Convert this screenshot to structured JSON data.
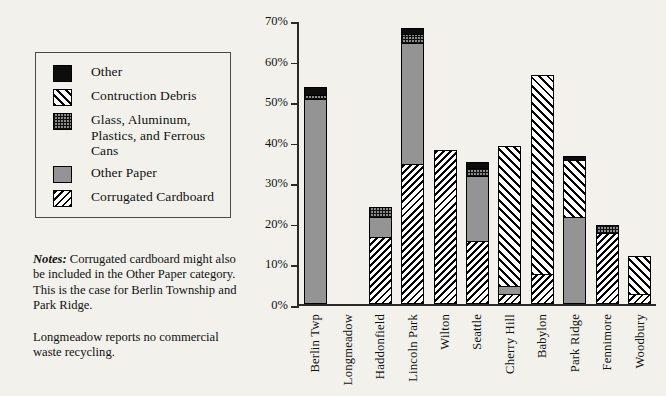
{
  "legend": {
    "items": [
      {
        "label": "Other",
        "key": "other",
        "swatch": "solid-black-swatch"
      },
      {
        "label": "Contruction Debris",
        "key": "construction_debris",
        "swatch": "diagonal-hatch-swatch"
      },
      {
        "label": "Glass, Aluminum, Plastics, and Ferrous Cans",
        "key": "glass",
        "swatch": "dotted-grid-swatch"
      },
      {
        "label": "Other Paper",
        "key": "other_paper",
        "swatch": "solid-gray-swatch"
      },
      {
        "label": "Corrugated Cardboard",
        "key": "corrugated_cardboard",
        "swatch": "dense-hatch-swatch"
      }
    ]
  },
  "notes": {
    "keyword": "Notes:",
    "paragraph1": "Corrugated cardboard might also be included in the Other Paper category. This is the case for Berlin Township and Park Ridge.",
    "paragraph2": "Longmeadow reports no commercial waste recycling."
  },
  "chart_data": {
    "type": "bar",
    "stacked": true,
    "title": "",
    "xlabel": "",
    "ylabel": "",
    "ylim": [
      0,
      70
    ],
    "yticks": [
      "0%",
      "10%",
      "20%",
      "30%",
      "40%",
      "50%",
      "60%",
      "70%"
    ],
    "grid": false,
    "legend_position": "left-outside",
    "categories": [
      "Berlin Twp",
      "Longmeadow",
      "Haddonfield",
      "Lincoln Park",
      "Wilton",
      "Seattle",
      "Cherry Hill",
      "Babylon",
      "Park Ridge",
      "Fennimore",
      "Woodbury"
    ],
    "series": [
      {
        "name": "Corrugated Cardboard",
        "key": "corrugated_cardboard",
        "values": [
          0,
          0,
          16.0,
          34.0,
          37.5,
          15.0,
          2.0,
          7.0,
          0,
          17.0,
          2.0
        ]
      },
      {
        "name": "Other Paper",
        "key": "other_paper",
        "values": [
          50.0,
          0,
          5.0,
          30.0,
          0,
          16.0,
          2.0,
          0,
          21.0,
          0,
          0
        ]
      },
      {
        "name": "Glass, Aluminum, Plastics, and Ferrous Cans",
        "key": "glass",
        "values": [
          1.0,
          0,
          2.5,
          2.0,
          0,
          2.0,
          0,
          0,
          0,
          2.0,
          0
        ]
      },
      {
        "name": "Contruction Debris",
        "key": "construction_debris",
        "values": [
          0,
          0,
          0,
          0,
          0,
          0,
          34.5,
          49.0,
          14.0,
          0,
          9.5
        ]
      },
      {
        "name": "Other",
        "key": "other",
        "values": [
          2.0,
          0,
          0,
          1.5,
          0,
          1.5,
          0,
          0,
          1.0,
          0,
          0
        ]
      }
    ],
    "totals": [
      53.0,
      0,
      23.5,
      67.5,
      37.5,
      34.5,
      38.5,
      56.0,
      36.0,
      19.0,
      11.5
    ]
  },
  "colors": {
    "background": "#f2f1ec",
    "axis": "#2a2a28",
    "other": "#0d0d0d",
    "other_paper": "#949494",
    "glass": "#8b8b8b",
    "ink": "#111111"
  }
}
